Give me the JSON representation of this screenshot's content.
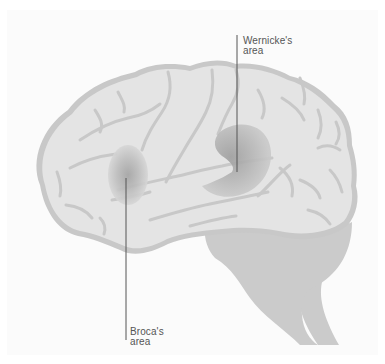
{
  "diagram": {
    "colors": {
      "background": "#ffffff",
      "panel": "#fbfbfb",
      "cortex_fill": "#e4e4e4",
      "sulci": "#c8c8c8",
      "cerebellum_brainstem": "#cbcbcb",
      "highlight_area": "#9e9e9e",
      "leader_line": "#555555",
      "label_text": "#555555"
    },
    "labels": [
      {
        "id": "wernicke",
        "line1": "Wernicke's",
        "line2": "area"
      },
      {
        "id": "broca",
        "line1": "Broca's",
        "line2": "area"
      }
    ]
  }
}
